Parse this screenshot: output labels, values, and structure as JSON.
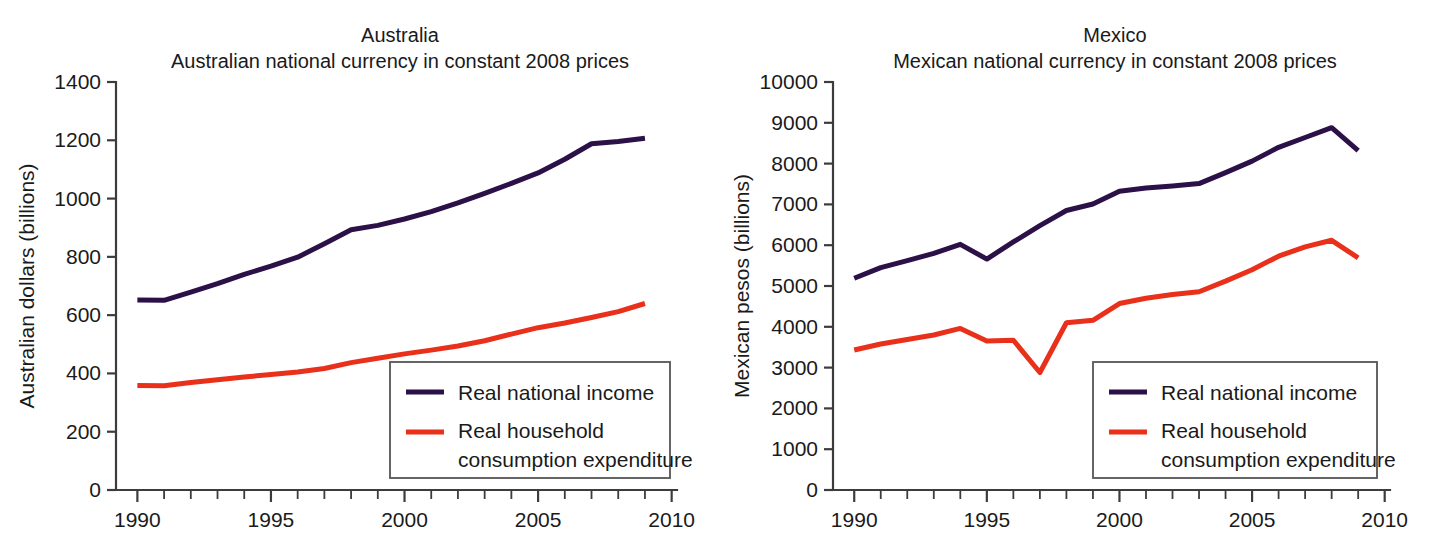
{
  "figure": {
    "background": "#ffffff",
    "panels": [
      "australia",
      "mexico"
    ]
  },
  "colors": {
    "income": "#2b1147",
    "consumption": "#e8301a",
    "axis": "#3c3c3c",
    "text": "#1a1a1a",
    "legend_border": "#555555"
  },
  "legend": {
    "income_label": "Real national income",
    "consumption_label_line1": "Real household",
    "consumption_label_line2": "consumption expenditure"
  },
  "chart_data": [
    {
      "type": "line",
      "id": "australia",
      "title": "Australia",
      "subtitle": "Australian national currency in constant 2008 prices",
      "xlabel": "",
      "ylabel": "Australian dollars (billions)",
      "xlim": [
        1989.2,
        2010.2
      ],
      "ylim": [
        0,
        1400
      ],
      "ytick_values": [
        0,
        200,
        400,
        600,
        800,
        1000,
        1200,
        1400
      ],
      "ytick_labels": [
        "0",
        "200",
        "400",
        "600",
        "800",
        "1000",
        "1200",
        "1400"
      ],
      "xtick_values": [
        1990,
        1995,
        2000,
        2005,
        2010
      ],
      "xtick_labels": [
        "1990",
        "1995",
        "2000",
        "2005",
        "2010"
      ],
      "xtick_minor_step": 1,
      "grid": false,
      "legend_position": "lower right",
      "x": [
        1990,
        1991,
        1992,
        1993,
        1994,
        1995,
        1996,
        1997,
        1998,
        1999,
        2000,
        2001,
        2002,
        2003,
        2004,
        2005,
        2006,
        2007,
        2008,
        2009
      ],
      "series": [
        {
          "name": "Real national income",
          "color": "#2b1147",
          "values": [
            652,
            651,
            679,
            708,
            740,
            768,
            799,
            845,
            893,
            908,
            930,
            955,
            985,
            1018,
            1052,
            1088,
            1135,
            1188,
            1196,
            1207
          ]
        },
        {
          "name": "Real household consumption expenditure",
          "color": "#e8301a",
          "values": [
            359,
            358,
            369,
            378,
            388,
            396,
            405,
            417,
            437,
            452,
            467,
            480,
            494,
            512,
            535,
            557,
            573,
            592,
            612,
            640
          ]
        }
      ]
    },
    {
      "type": "line",
      "id": "mexico",
      "title": "Mexico",
      "subtitle": "Mexican national currency in constant 2008 prices",
      "xlabel": "",
      "ylabel": "Mexican pesos (billions)",
      "xlim": [
        1989.2,
        2010.2
      ],
      "ylim": [
        0,
        10000
      ],
      "ytick_values": [
        0,
        1000,
        2000,
        3000,
        4000,
        5000,
        6000,
        7000,
        8000,
        9000,
        10000
      ],
      "ytick_labels": [
        "0",
        "1000",
        "2000",
        "3000",
        "4000",
        "5000",
        "6000",
        "7000",
        "8000",
        "9000",
        "10000"
      ],
      "xtick_values": [
        1990,
        1995,
        2000,
        2005,
        2010
      ],
      "xtick_labels": [
        "1990",
        "1995",
        "2000",
        "2005",
        "2010"
      ],
      "xtick_minor_step": 1,
      "grid": false,
      "legend_position": "lower right",
      "x": [
        1990,
        1991,
        1992,
        1993,
        1994,
        1995,
        1996,
        1997,
        1998,
        1999,
        2000,
        2001,
        2002,
        2003,
        2004,
        2005,
        2006,
        2007,
        2008,
        2009
      ],
      "series": [
        {
          "name": "Real national income",
          "color": "#2b1147",
          "values": [
            5190,
            5450,
            5620,
            5800,
            6020,
            5660,
            6080,
            6480,
            6850,
            7010,
            7320,
            7400,
            7450,
            7510,
            7780,
            8060,
            8400,
            8640,
            8880,
            8320
          ]
        },
        {
          "name": "Real household consumption expenditure",
          "color": "#e8301a",
          "values": [
            3430,
            3580,
            3690,
            3800,
            3960,
            3650,
            3670,
            2880,
            4100,
            4160,
            4570,
            4700,
            4790,
            4860,
            5120,
            5400,
            5730,
            5960,
            6120,
            5690
          ]
        }
      ]
    }
  ]
}
